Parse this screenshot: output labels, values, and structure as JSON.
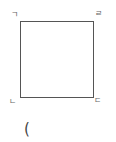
{
  "diagram": {
    "shape": "square",
    "stroke_color": "#555555",
    "vertices": {
      "top_left": "ㄱ",
      "top_right": "ㄹ",
      "bottom_left": "ㄴ",
      "bottom_right": "ㄷ"
    },
    "caption": "("
  }
}
